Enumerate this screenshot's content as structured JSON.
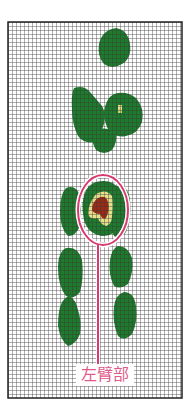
{
  "figure": {
    "type": "thermal-grid-map",
    "label": "左臂部",
    "colors": {
      "background": "#ffffff",
      "grid_line": "#333333",
      "frame": "#222222",
      "green": "#1e7a2c",
      "light_green": "#3f9a3a",
      "yellow": "#e6e08a",
      "red": "#9a2a18",
      "callout": "#d63a6e",
      "label_text": "#e05a8a"
    },
    "grid": {
      "x": 8,
      "y": 22,
      "width": 174,
      "height": 376,
      "cell": 4
    },
    "callout": {
      "ellipse": {
        "cx": 103,
        "cy": 210,
        "rx": 24,
        "ry": 34
      },
      "line_x": 98,
      "line_top": 244,
      "line_bottom": 364
    }
  }
}
